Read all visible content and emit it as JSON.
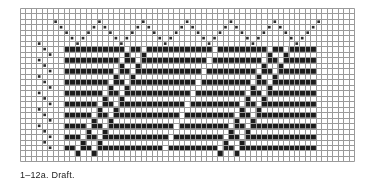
{
  "figure": {
    "caption": "1–12a.  Draft.",
    "title": "Weaving draft grid",
    "colors": {
      "ink": "#1c1c1c",
      "grid_line": "#9a9a9a",
      "grid_line_minor": "#bdbdbd",
      "background": "#ffffff",
      "mark": "#2b2b2b"
    },
    "grid": {
      "origin_x": 20,
      "origin_y": 8,
      "cell": 5.48,
      "cols": 61,
      "rows": 28,
      "line_width": 1
    }
  },
  "chart_data": {
    "type": "heatmap",
    "title": "1–12a.  Draft.",
    "xlabel": "",
    "ylabel": "",
    "grid": true,
    "legend": "none",
    "columns": 61,
    "rows": 28,
    "threading_marks": [
      {
        "col": 6,
        "row": 2
      },
      {
        "col": 7,
        "row": 3
      },
      {
        "col": 8,
        "row": 4
      },
      {
        "col": 9,
        "row": 5
      },
      {
        "col": 10,
        "row": 6
      },
      {
        "col": 11,
        "row": 5
      },
      {
        "col": 12,
        "row": 4
      },
      {
        "col": 13,
        "row": 3
      },
      {
        "col": 14,
        "row": 2
      },
      {
        "col": 15,
        "row": 3
      },
      {
        "col": 16,
        "row": 4
      },
      {
        "col": 17,
        "row": 5
      },
      {
        "col": 18,
        "row": 6
      },
      {
        "col": 19,
        "row": 5
      },
      {
        "col": 20,
        "row": 4
      },
      {
        "col": 21,
        "row": 3
      },
      {
        "col": 22,
        "row": 2
      },
      {
        "col": 23,
        "row": 3
      },
      {
        "col": 24,
        "row": 4
      },
      {
        "col": 25,
        "row": 5
      },
      {
        "col": 26,
        "row": 6
      },
      {
        "col": 27,
        "row": 5
      },
      {
        "col": 28,
        "row": 4
      },
      {
        "col": 29,
        "row": 3
      },
      {
        "col": 30,
        "row": 2
      },
      {
        "col": 31,
        "row": 3
      },
      {
        "col": 32,
        "row": 4
      },
      {
        "col": 33,
        "row": 5
      },
      {
        "col": 34,
        "row": 6
      },
      {
        "col": 35,
        "row": 5
      },
      {
        "col": 36,
        "row": 4
      },
      {
        "col": 37,
        "row": 3
      },
      {
        "col": 38,
        "row": 2
      },
      {
        "col": 39,
        "row": 3
      },
      {
        "col": 40,
        "row": 4
      },
      {
        "col": 41,
        "row": 5
      },
      {
        "col": 42,
        "row": 6
      },
      {
        "col": 43,
        "row": 5
      },
      {
        "col": 44,
        "row": 4
      },
      {
        "col": 45,
        "row": 3
      },
      {
        "col": 46,
        "row": 2
      },
      {
        "col": 47,
        "row": 3
      },
      {
        "col": 48,
        "row": 4
      },
      {
        "col": 49,
        "row": 5
      },
      {
        "col": 50,
        "row": 6
      },
      {
        "col": 51,
        "row": 5
      },
      {
        "col": 52,
        "row": 4
      },
      {
        "col": 53,
        "row": 3
      },
      {
        "col": 54,
        "row": 2
      }
    ],
    "tieup_marks": [
      {
        "col": 3,
        "row": 6
      },
      {
        "col": 4,
        "row": 7
      },
      {
        "col": 5,
        "row": 8
      },
      {
        "col": 3,
        "row": 9
      },
      {
        "col": 4,
        "row": 10
      },
      {
        "col": 5,
        "row": 11
      },
      {
        "col": 3,
        "row": 12
      },
      {
        "col": 4,
        "row": 13
      },
      {
        "col": 5,
        "row": 14
      },
      {
        "col": 3,
        "row": 15
      },
      {
        "col": 4,
        "row": 16
      },
      {
        "col": 5,
        "row": 17
      },
      {
        "col": 3,
        "row": 18
      },
      {
        "col": 4,
        "row": 19
      },
      {
        "col": 5,
        "row": 20
      },
      {
        "col": 3,
        "row": 21
      },
      {
        "col": 4,
        "row": 22
      },
      {
        "col": 5,
        "row": 23
      },
      {
        "col": 4,
        "row": 24
      },
      {
        "col": 5,
        "row": 25
      }
    ],
    "drawdown": {
      "col_start": 8,
      "row_start": 7,
      "col_end": 53,
      "row_end": 27,
      "rows": [
        {
          "row": 7,
          "runs": [
            [
              8,
              18
            ],
            [
              20,
              21
            ],
            [
              23,
              34
            ],
            [
              36,
              44
            ],
            [
              46,
              47
            ],
            [
              49,
              53
            ]
          ]
        },
        {
          "row": 8,
          "runs": [
            [
              19,
              19
            ],
            [
              22,
              22
            ],
            [
              45,
              45
            ],
            [
              48,
              48
            ]
          ]
        },
        {
          "row": 9,
          "runs": [
            [
              8,
              17
            ],
            [
              19,
              20
            ],
            [
              22,
              33
            ],
            [
              35,
              43
            ],
            [
              45,
              46
            ],
            [
              48,
              53
            ]
          ]
        },
        {
          "row": 10,
          "runs": [
            [
              18,
              18
            ],
            [
              21,
              21
            ],
            [
              44,
              44
            ],
            [
              47,
              47
            ]
          ]
        },
        {
          "row": 11,
          "runs": [
            [
              8,
              16
            ],
            [
              18,
              19
            ],
            [
              21,
              32
            ],
            [
              34,
              42
            ],
            [
              44,
              45
            ],
            [
              47,
              53
            ]
          ]
        },
        {
          "row": 12,
          "runs": [
            [
              17,
              17
            ],
            [
              20,
              20
            ],
            [
              43,
              43
            ],
            [
              46,
              46
            ]
          ]
        },
        {
          "row": 13,
          "runs": [
            [
              8,
              15
            ],
            [
              17,
              18
            ],
            [
              20,
              31
            ],
            [
              33,
              41
            ],
            [
              43,
              44
            ],
            [
              46,
              53
            ]
          ]
        },
        {
          "row": 14,
          "runs": [
            [
              16,
              16
            ],
            [
              19,
              19
            ],
            [
              42,
              42
            ],
            [
              45,
              45
            ]
          ]
        },
        {
          "row": 15,
          "runs": [
            [
              8,
              14
            ],
            [
              16,
              17
            ],
            [
              19,
              30
            ],
            [
              32,
              40
            ],
            [
              42,
              43
            ],
            [
              45,
              53
            ]
          ]
        },
        {
          "row": 16,
          "runs": [
            [
              15,
              15
            ],
            [
              18,
              18
            ],
            [
              41,
              41
            ],
            [
              44,
              44
            ]
          ]
        },
        {
          "row": 17,
          "runs": [
            [
              8,
              13
            ],
            [
              15,
              16
            ],
            [
              18,
              29
            ],
            [
              31,
              39
            ],
            [
              41,
              42
            ],
            [
              44,
              53
            ]
          ]
        },
        {
          "row": 18,
          "runs": [
            [
              14,
              14
            ],
            [
              17,
              17
            ],
            [
              40,
              40
            ],
            [
              43,
              43
            ]
          ]
        },
        {
          "row": 19,
          "runs": [
            [
              8,
              12
            ],
            [
              14,
              15
            ],
            [
              17,
              28
            ],
            [
              30,
              38
            ],
            [
              40,
              41
            ],
            [
              43,
              53
            ]
          ]
        },
        {
          "row": 20,
          "runs": [
            [
              13,
              13
            ],
            [
              16,
              16
            ],
            [
              39,
              39
            ],
            [
              42,
              42
            ]
          ]
        },
        {
          "row": 21,
          "runs": [
            [
              8,
              11
            ],
            [
              13,
              14
            ],
            [
              16,
              27
            ],
            [
              29,
              37
            ],
            [
              39,
              40
            ],
            [
              42,
              53
            ]
          ]
        },
        {
          "row": 22,
          "runs": [
            [
              12,
              12
            ],
            [
              15,
              15
            ],
            [
              38,
              38
            ],
            [
              41,
              41
            ]
          ]
        },
        {
          "row": 23,
          "runs": [
            [
              8,
              10
            ],
            [
              12,
              13
            ],
            [
              15,
              26
            ],
            [
              28,
              36
            ],
            [
              38,
              39
            ],
            [
              41,
              53
            ]
          ]
        },
        {
          "row": 24,
          "runs": [
            [
              11,
              11
            ],
            [
              14,
              14
            ],
            [
              37,
              37
            ],
            [
              40,
              40
            ]
          ]
        },
        {
          "row": 25,
          "runs": [
            [
              8,
              9
            ],
            [
              11,
              12
            ],
            [
              14,
              25
            ],
            [
              27,
              35
            ],
            [
              37,
              38
            ],
            [
              40,
              53
            ]
          ]
        },
        {
          "row": 26,
          "runs": [
            [
              10,
              10
            ],
            [
              13,
              13
            ],
            [
              36,
              36
            ],
            [
              39,
              39
            ]
          ]
        }
      ]
    }
  }
}
